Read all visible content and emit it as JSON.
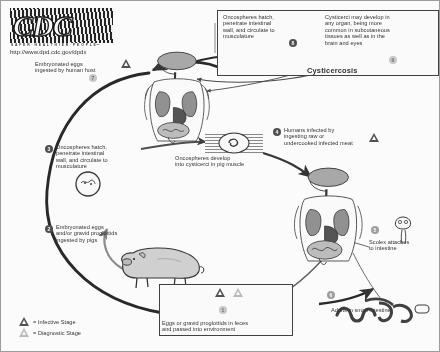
{
  "diagram": {
    "source_org": "CDC",
    "logo_text": "CDC",
    "logo_tagline": "S A F E R · H E A L T H I E R · P E O P L E™",
    "url": "http://www.dpd.cdc.gov/dpdx",
    "disease_label": "Cysticercosis"
  },
  "steps": {
    "s1": "1",
    "s2": "2",
    "s3": "3",
    "s4": "4",
    "s5": "5",
    "s6": "6",
    "s7": "7",
    "s8": "8",
    "s9": "9"
  },
  "labels": {
    "step7": "Embryonated eggs\ningested by human host",
    "step8": "Oncospheres hatch,\npenetrate intestinal\nwall, and circulate to\nmusculature",
    "step9": "Cysticerci may develop in\nany organ, being more\ncommon in subcutaneous\ntissues as well as in the\nbrain and eyes",
    "step3": "Oncospheres hatch,\npenetrate intestinal\nwall, and circulate to\nmusculature",
    "step2": "Embryonated eggs\nand/or gravid proglottids\ningested by pigs",
    "step4": "Humans infected by\ningesting raw or\nundercooked infected meat",
    "step5": "Scolex attaches\nto intestine",
    "step6": "Adults in small intestine",
    "center_note": "Oncospheres develop\ninto cysticerci in pig muscle",
    "step1": "Eggs or gravid proglottids in feces\nand passed into environment"
  },
  "legend": {
    "infective": "= Infective Stage",
    "diagnostic": "= Diagnostic Stage"
  },
  "icons": {
    "infective_triangle": "infective-stage-triangle-icon",
    "diagnostic_triangle": "diagnostic-stage-triangle-icon",
    "human_host": "human-anatomy-figure-icon",
    "pig": "pig-icon",
    "egg": "taenia-egg-icon",
    "cysticercus": "cysticercus-icon",
    "muscle": "pig-muscle-tissue-icon",
    "scolex": "scolex-icon",
    "adult_worm": "adult-tapeworm-icon",
    "proglottid": "gravid-proglottid-icon"
  },
  "colors": {
    "ink": "#2b2b2b",
    "organ_fill": "#9a9a9a",
    "organ_dark": "#4a4a4a",
    "paper": "#ffffff"
  }
}
